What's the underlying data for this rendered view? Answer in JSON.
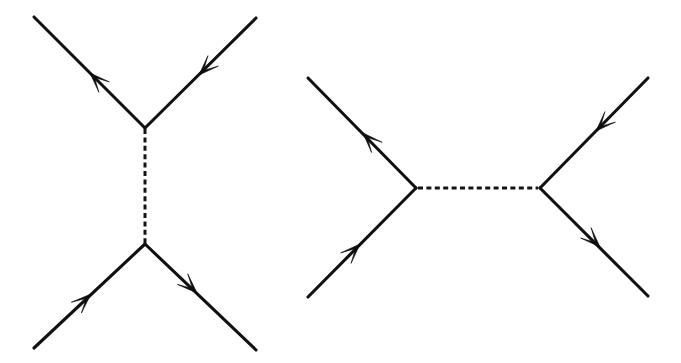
{
  "figure": {
    "background_color": "#ffffff",
    "line_color": "#111111",
    "arrow_color": "#0d0d0d",
    "width": 681,
    "height": 363,
    "diagram_count": 2
  },
  "diagrams": [
    {
      "id": "left-diagram",
      "name": "t-channel-diagram",
      "channel": "t",
      "propagator": {
        "name": "dashed-propagator-vertical",
        "style": "dashed",
        "dash_pattern": "5 3.4",
        "x1": 145,
        "y1": 129,
        "x2": 145,
        "y2": 243,
        "color": "#141414"
      },
      "vertices": [
        {
          "name": "upper-vertex",
          "x": 145,
          "y": 128
        },
        {
          "name": "lower-vertex",
          "x": 145,
          "y": 244
        }
      ],
      "legs": [
        {
          "name": "upper-left-leg",
          "x1": 34,
          "y1": 17,
          "x2": 145,
          "y2": 128,
          "arrow": {
            "x": 90,
            "y": 73,
            "angle": -135,
            "direction": "up-left"
          }
        },
        {
          "name": "upper-right-leg",
          "x1": 256,
          "y1": 18,
          "x2": 145,
          "y2": 128,
          "arrow": {
            "x": 199,
            "y": 75,
            "angle": 135,
            "direction": "down-left"
          }
        },
        {
          "name": "lower-left-leg",
          "x1": 34,
          "y1": 348,
          "x2": 145,
          "y2": 244,
          "arrow": {
            "x": 91,
            "y": 294,
            "angle": -43,
            "direction": "up-right"
          }
        },
        {
          "name": "lower-right-leg",
          "x1": 256,
          "y1": 350,
          "x2": 145,
          "y2": 244,
          "arrow": {
            "x": 197,
            "y": 293,
            "angle": 44,
            "direction": "down-right"
          }
        }
      ]
    },
    {
      "id": "right-diagram",
      "name": "s-channel-diagram",
      "channel": "s",
      "propagator": {
        "name": "dashed-propagator-horizontal",
        "style": "dashed",
        "dash_pattern": "5 3.4",
        "x1": 418,
        "y1": 188,
        "x2": 538,
        "y2": 188,
        "color": "#141414"
      },
      "vertices": [
        {
          "name": "left-vertex",
          "x": 416,
          "y": 188
        },
        {
          "name": "right-vertex",
          "x": 540,
          "y": 188
        }
      ],
      "legs": [
        {
          "name": "upper-left-leg",
          "x1": 308,
          "y1": 78,
          "x2": 416,
          "y2": 188,
          "arrow": {
            "x": 363,
            "y": 133,
            "angle": -134,
            "direction": "up-left"
          }
        },
        {
          "name": "lower-left-leg",
          "x1": 308,
          "y1": 297,
          "x2": 416,
          "y2": 188,
          "arrow": {
            "x": 360,
            "y": 244,
            "angle": -45,
            "direction": "up-right"
          }
        },
        {
          "name": "upper-right-leg",
          "x1": 648,
          "y1": 78,
          "x2": 540,
          "y2": 188,
          "arrow": {
            "x": 596,
            "y": 131,
            "angle": 135,
            "direction": "down-left"
          }
        },
        {
          "name": "lower-right-leg",
          "x1": 648,
          "y1": 296,
          "x2": 540,
          "y2": 188,
          "arrow": {
            "x": 600,
            "y": 247,
            "angle": 45,
            "direction": "down-right"
          }
        }
      ]
    }
  ]
}
